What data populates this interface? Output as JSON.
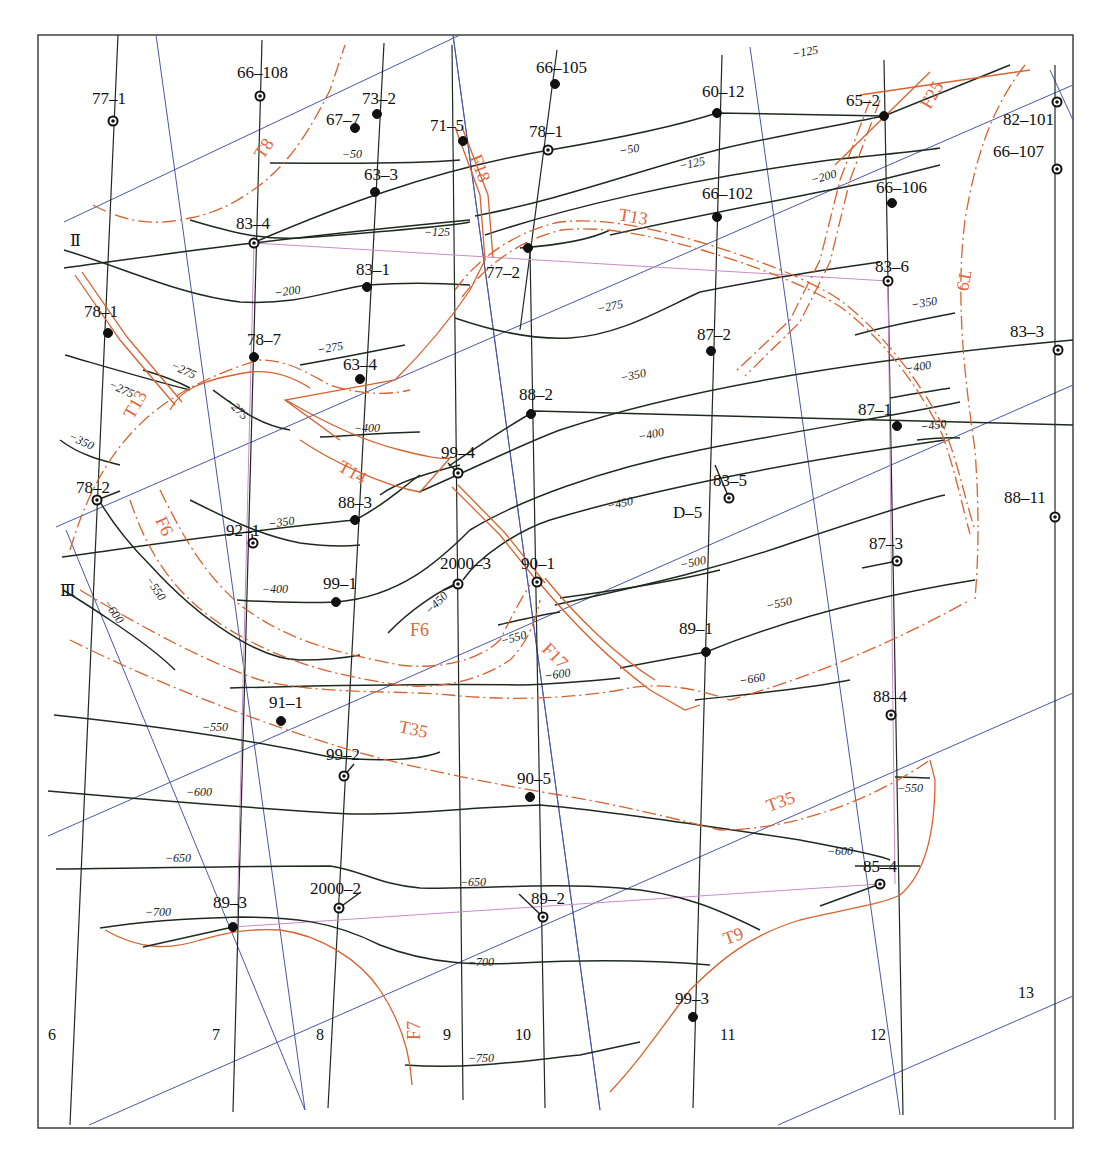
{
  "map": {
    "title": "",
    "frame": {
      "x": 38,
      "y": 35,
      "width": 1035,
      "height": 1093
    },
    "colors": {
      "contour": "#1f2a1f",
      "fault": "#d9622e",
      "fault_label": "#e2643a",
      "survey_line_blue": "#4a56a8",
      "section_line_pink": "#c98bc9",
      "background": "#ffffff"
    },
    "section_labels": [
      {
        "id": "II",
        "text": "Ⅱ",
        "x": 70,
        "y": 246
      },
      {
        "id": "III",
        "text": "Ⅲ",
        "x": 60,
        "y": 596
      }
    ],
    "grid_line_labels": [
      {
        "text": "6",
        "x": 48,
        "y": 1040
      },
      {
        "text": "7",
        "x": 212,
        "y": 1040
      },
      {
        "text": "8",
        "x": 316,
        "y": 1040
      },
      {
        "text": "9",
        "x": 443,
        "y": 1040
      },
      {
        "text": "10",
        "x": 515,
        "y": 1040
      },
      {
        "text": "11",
        "x": 720,
        "y": 1040
      },
      {
        "text": "12",
        "x": 870,
        "y": 1040
      },
      {
        "text": "13",
        "x": 1018,
        "y": 998
      }
    ],
    "wells": [
      {
        "name": "77-1",
        "x": 113,
        "y": 121,
        "type": "ring",
        "lx": 92,
        "ly": 104
      },
      {
        "name": "66-108",
        "x": 260,
        "y": 96,
        "type": "ring",
        "lx": 237,
        "ly": 78
      },
      {
        "name": "67-7",
        "x": 355,
        "y": 128,
        "type": "solid",
        "lx": 326,
        "ly": 125
      },
      {
        "name": "73-2",
        "x": 377,
        "y": 114,
        "type": "solid",
        "lx": 362,
        "ly": 104
      },
      {
        "name": "71-5",
        "x": 463,
        "y": 141,
        "type": "solid",
        "lx": 430,
        "ly": 131
      },
      {
        "name": "66-105",
        "x": 555,
        "y": 84,
        "type": "solid",
        "lx": 536,
        "ly": 73
      },
      {
        "name": "78-1",
        "x": 548,
        "y": 150,
        "type": "ring",
        "lx": 529,
        "ly": 137
      },
      {
        "name": "60-12",
        "x": 717,
        "y": 113,
        "type": "solid",
        "lx": 702,
        "ly": 97
      },
      {
        "name": "65-2",
        "x": 884,
        "y": 116,
        "type": "solid",
        "lx": 846,
        "ly": 106
      },
      {
        "name": "82-101",
        "x": 1057,
        "y": 102,
        "type": "ring",
        "lx": 1003,
        "ly": 125
      },
      {
        "name": "66-107",
        "x": 1057,
        "y": 169,
        "type": "ring",
        "lx": 993,
        "ly": 157
      },
      {
        "name": "63-3",
        "x": 375,
        "y": 192,
        "type": "solid",
        "lx": 364,
        "ly": 180
      },
      {
        "name": "66-102",
        "x": 717,
        "y": 217,
        "type": "solid",
        "lx": 702,
        "ly": 199
      },
      {
        "name": "66-106",
        "x": 892,
        "y": 203,
        "type": "solid",
        "lx": 876,
        "ly": 193
      },
      {
        "name": "83-4",
        "x": 254,
        "y": 243,
        "type": "ring",
        "lx": 236,
        "ly": 229
      },
      {
        "name": "77-2",
        "x": 528,
        "y": 248,
        "type": "solid",
        "lx": 486,
        "ly": 278
      },
      {
        "name": "83-1",
        "x": 367,
        "y": 287,
        "type": "solid",
        "lx": 356,
        "ly": 275
      },
      {
        "name": "83-6",
        "x": 888,
        "y": 281,
        "type": "ring",
        "lx": 875,
        "ly": 272
      },
      {
        "name": "78-1",
        "x": 108,
        "y": 333,
        "type": "solid",
        "lx": 84,
        "ly": 317
      },
      {
        "name": "78-7",
        "x": 254,
        "y": 357,
        "type": "solid",
        "lx": 247,
        "ly": 345
      },
      {
        "name": "63-4",
        "x": 360,
        "y": 379,
        "type": "solid",
        "lx": 343,
        "ly": 370
      },
      {
        "name": "87-2",
        "x": 711,
        "y": 351,
        "type": "solid",
        "lx": 697,
        "ly": 340
      },
      {
        "name": "83-3",
        "x": 1058,
        "y": 350,
        "type": "ring",
        "lx": 1010,
        "ly": 337
      },
      {
        "name": "88-2",
        "x": 531,
        "y": 414,
        "type": "solid",
        "lx": 519,
        "ly": 400
      },
      {
        "name": "87-1",
        "x": 897,
        "y": 426,
        "type": "solid",
        "lx": 858,
        "ly": 415
      },
      {
        "name": "99-4",
        "x": 458,
        "y": 473,
        "type": "ring",
        "lx": 441,
        "ly": 458
      },
      {
        "name": "83-5",
        "x": 729,
        "y": 498,
        "type": "ring",
        "lx": 713,
        "ly": 486
      },
      {
        "name": "D-5",
        "x": 0,
        "y": 0,
        "type": "label",
        "lx": 673,
        "ly": 518
      },
      {
        "name": "78-2",
        "x": 97,
        "y": 500,
        "type": "ring",
        "lx": 76,
        "ly": 493
      },
      {
        "name": "88-11",
        "x": 1055,
        "y": 517,
        "type": "ring",
        "lx": 1004,
        "ly": 503
      },
      {
        "name": "92-1",
        "x": 253,
        "y": 543,
        "type": "ring",
        "lx": 226,
        "ly": 536
      },
      {
        "name": "88-3",
        "x": 355,
        "y": 520,
        "type": "solid",
        "lx": 338,
        "ly": 508
      },
      {
        "name": "87-3",
        "x": 897,
        "y": 561,
        "type": "ring",
        "lx": 869,
        "ly": 549
      },
      {
        "name": "2000-3",
        "x": 458,
        "y": 584,
        "type": "ring",
        "lx": 440,
        "ly": 569
      },
      {
        "name": "90-1",
        "x": 537,
        "y": 582,
        "type": "ring",
        "lx": 521,
        "ly": 569
      },
      {
        "name": "99-1",
        "x": 336,
        "y": 602,
        "type": "solid",
        "lx": 323,
        "ly": 589
      },
      {
        "name": "89-1",
        "x": 706,
        "y": 652,
        "type": "solid",
        "lx": 679,
        "ly": 634
      },
      {
        "name": "91-1",
        "x": 281,
        "y": 721,
        "type": "solid",
        "lx": 269,
        "ly": 708
      },
      {
        "name": "88-4",
        "x": 891,
        "y": 715,
        "type": "ring",
        "lx": 873,
        "ly": 702
      },
      {
        "name": "99-2",
        "x": 344,
        "y": 776,
        "type": "ring",
        "lx": 326,
        "ly": 760
      },
      {
        "name": "90-5",
        "x": 530,
        "y": 797,
        "type": "solid",
        "lx": 517,
        "ly": 784
      },
      {
        "name": "85-4",
        "x": 880,
        "y": 884,
        "type": "ring",
        "lx": 863,
        "ly": 872
      },
      {
        "name": "2000-2",
        "x": 339,
        "y": 908,
        "type": "ring",
        "lx": 310,
        "ly": 894
      },
      {
        "name": "89-3",
        "x": 233,
        "y": 927,
        "type": "solid",
        "lx": 213,
        "ly": 908
      },
      {
        "name": "89-2",
        "x": 543,
        "y": 917,
        "type": "ring",
        "lx": 531,
        "ly": 904
      },
      {
        "name": "99-3",
        "x": 693,
        "y": 1017,
        "type": "solid",
        "lx": 675,
        "ly": 1004
      }
    ],
    "contour_labels": [
      {
        "text": "−50",
        "x": 342,
        "y": 158,
        "rot": 0
      },
      {
        "text": "−50",
        "x": 620,
        "y": 155,
        "rot": -10
      },
      {
        "text": "−125",
        "x": 680,
        "y": 170,
        "rot": -12
      },
      {
        "text": "−125",
        "x": 793,
        "y": 58,
        "rot": -10
      },
      {
        "text": "−200",
        "x": 812,
        "y": 184,
        "rot": -15
      },
      {
        "text": "−125",
        "x": 424,
        "y": 236,
        "rot": 0
      },
      {
        "text": "−200",
        "x": 275,
        "y": 297,
        "rot": -8
      },
      {
        "text": "−275",
        "x": 598,
        "y": 313,
        "rot": -12
      },
      {
        "text": "−350",
        "x": 912,
        "y": 309,
        "rot": -10
      },
      {
        "text": "−275",
        "x": 170,
        "y": 368,
        "rot": 25
      },
      {
        "text": "−275",
        "x": 108,
        "y": 387,
        "rot": 25
      },
      {
        "text": "−275",
        "x": 318,
        "y": 354,
        "rot": -10
      },
      {
        "text": "−275",
        "x": 225,
        "y": 402,
        "rot": 45
      },
      {
        "text": "−400",
        "x": 354,
        "y": 432,
        "rot": 0
      },
      {
        "text": "−350",
        "x": 621,
        "y": 382,
        "rot": -12
      },
      {
        "text": "−400",
        "x": 906,
        "y": 373,
        "rot": -10
      },
      {
        "text": "−400",
        "x": 639,
        "y": 441,
        "rot": -12
      },
      {
        "text": "−450",
        "x": 921,
        "y": 431,
        "rot": -8
      },
      {
        "text": "−350",
        "x": 68,
        "y": 439,
        "rot": 25
      },
      {
        "text": "−350",
        "x": 269,
        "y": 528,
        "rot": -8
      },
      {
        "text": "−450",
        "x": 608,
        "y": 510,
        "rot": -12
      },
      {
        "text": "−500",
        "x": 681,
        "y": 569,
        "rot": -12
      },
      {
        "text": "−550",
        "x": 145,
        "y": 580,
        "rot": 55
      },
      {
        "text": "−600",
        "x": 103,
        "y": 603,
        "rot": 55
      },
      {
        "text": "−400",
        "x": 262,
        "y": 593,
        "rot": 0
      },
      {
        "text": "−450",
        "x": 430,
        "y": 615,
        "rot": -45
      },
      {
        "text": "−550",
        "x": 502,
        "y": 645,
        "rot": -15
      },
      {
        "text": "−550",
        "x": 767,
        "y": 610,
        "rot": -12
      },
      {
        "text": "−600",
        "x": 545,
        "y": 680,
        "rot": -8
      },
      {
        "text": "−660",
        "x": 740,
        "y": 685,
        "rot": -10
      },
      {
        "text": "−550",
        "x": 202,
        "y": 731,
        "rot": 0
      },
      {
        "text": "−600",
        "x": 186,
        "y": 796,
        "rot": 0
      },
      {
        "text": "−550",
        "x": 897,
        "y": 792,
        "rot": 0
      },
      {
        "text": "−650",
        "x": 165,
        "y": 862,
        "rot": 0
      },
      {
        "text": "−600",
        "x": 827,
        "y": 855,
        "rot": 0
      },
      {
        "text": "−650",
        "x": 460,
        "y": 886,
        "rot": 0
      },
      {
        "text": "−700",
        "x": 145,
        "y": 916,
        "rot": 0
      },
      {
        "text": "−700",
        "x": 468,
        "y": 966,
        "rot": 0
      },
      {
        "text": "−750",
        "x": 468,
        "y": 1062,
        "rot": 0
      }
    ],
    "fault_labels": [
      {
        "text": "T8",
        "x": 263,
        "y": 160,
        "rot": -55
      },
      {
        "text": "F18",
        "x": 470,
        "y": 157,
        "rot": 70
      },
      {
        "text": "F25",
        "x": 930,
        "y": 110,
        "rot": -60
      },
      {
        "text": "T13",
        "x": 618,
        "y": 220,
        "rot": 10
      },
      {
        "text": "T9",
        "x": 960,
        "y": 270,
        "rot": 100
      },
      {
        "text": "T13",
        "x": 133,
        "y": 420,
        "rot": -60
      },
      {
        "text": "T14",
        "x": 337,
        "y": 470,
        "rot": 30
      },
      {
        "text": "F6",
        "x": 155,
        "y": 520,
        "rot": 65
      },
      {
        "text": "F6",
        "x": 410,
        "y": 636,
        "rot": 0
      },
      {
        "text": "F17",
        "x": 541,
        "y": 650,
        "rot": 45
      },
      {
        "text": "T35",
        "x": 398,
        "y": 732,
        "rot": 12
      },
      {
        "text": "T35",
        "x": 769,
        "y": 812,
        "rot": -20
      },
      {
        "text": "T9",
        "x": 726,
        "y": 945,
        "rot": -20
      },
      {
        "text": "F7",
        "x": 420,
        "y": 1040,
        "rot": -90
      }
    ]
  }
}
